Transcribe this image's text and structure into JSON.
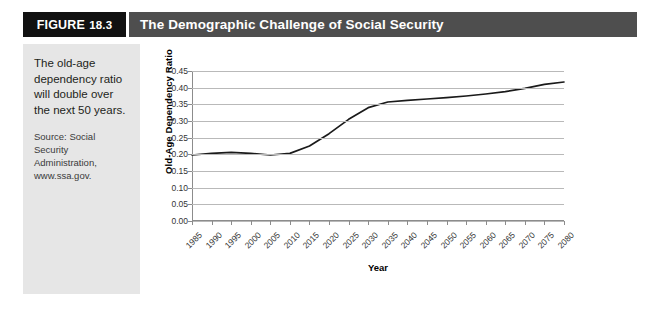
{
  "figure": {
    "number_word": "FIGURE",
    "number": "18.3",
    "title": "The Demographic Challenge of Social Security"
  },
  "sidebar": {
    "caption": "The old-age dependency ratio will double over the next 50 years.",
    "source": "Source: Social Security Administration, www.ssa.gov."
  },
  "colors": {
    "titlebar": "#4e4e4e",
    "figure_box": "#111111",
    "sidebar_bg": "#e6e6e6",
    "panel_bg": "#ffffff",
    "line": "#1a1a1a",
    "gridline": "#b9b9b9",
    "axis": "#8c8c8c"
  },
  "chart_data": {
    "type": "line",
    "title": "",
    "xlabel": "Year",
    "ylabel": "Old-Age Dependency Ratio",
    "xlim": [
      1985,
      2080
    ],
    "ylim": [
      0.0,
      0.45
    ],
    "grid": true,
    "legend": "none",
    "y_ticks": [
      "0.00",
      "0.05",
      "0.10",
      "0.15",
      "0.20",
      "0.25",
      "0.30",
      "0.35",
      "0.40",
      "0.45"
    ],
    "y_tick_values": [
      0.0,
      0.05,
      0.1,
      0.15,
      0.2,
      0.25,
      0.3,
      0.35,
      0.4,
      0.45
    ],
    "categories": [
      "1985",
      "1990",
      "1995",
      "2000",
      "2005",
      "2010",
      "2015",
      "2020",
      "2025",
      "2030",
      "2035",
      "2040",
      "2045",
      "2050",
      "2055",
      "2060",
      "2065",
      "2070",
      "2075",
      "2080"
    ],
    "x": [
      1985,
      1990,
      1995,
      2000,
      2005,
      2010,
      2015,
      2020,
      2025,
      2030,
      2035,
      2040,
      2045,
      2050,
      2055,
      2060,
      2065,
      2070,
      2075,
      2080
    ],
    "values": [
      0.198,
      0.203,
      0.206,
      0.203,
      0.198,
      0.203,
      0.225,
      0.262,
      0.305,
      0.34,
      0.357,
      0.362,
      0.366,
      0.37,
      0.375,
      0.381,
      0.388,
      0.398,
      0.41,
      0.417
    ],
    "series": [
      {
        "name": "Old-Age Dependency Ratio",
        "values": [
          0.198,
          0.203,
          0.206,
          0.203,
          0.198,
          0.203,
          0.225,
          0.262,
          0.305,
          0.34,
          0.357,
          0.362,
          0.366,
          0.37,
          0.375,
          0.381,
          0.388,
          0.398,
          0.41,
          0.417
        ]
      }
    ]
  }
}
